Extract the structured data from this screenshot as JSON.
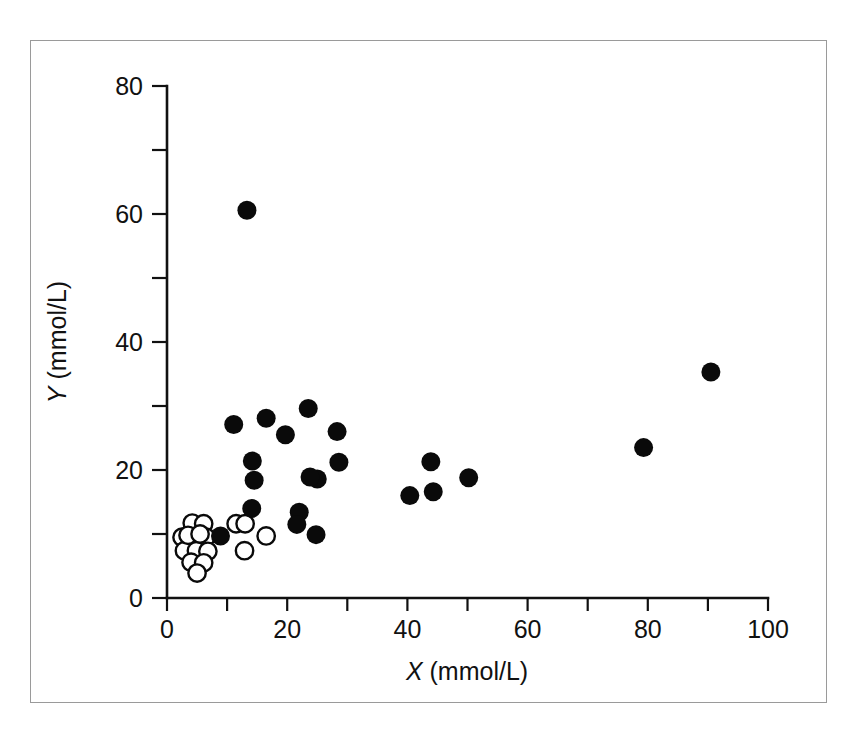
{
  "figure": {
    "background_color": "#ffffff",
    "frame_color": "#9a9a9a",
    "ink_color": "#0a0a0a"
  },
  "axis": {
    "x_title_var": "X",
    "x_title_unit": " (mmol/L)",
    "y_title_var": "Y",
    "y_title_unit": " (mmol/L)",
    "x_tick_labels": [
      "0",
      "20",
      "40",
      "60",
      "80",
      "100"
    ],
    "y_tick_labels": [
      "0",
      "20",
      "40",
      "60",
      "80"
    ]
  },
  "chart_data": {
    "type": "scatter",
    "title": "",
    "xlabel": "X (mmol/L)",
    "ylabel": "Y (mmol/L)",
    "xlim": [
      0,
      100
    ],
    "ylim": [
      0,
      80
    ],
    "xticks": [
      0,
      20,
      40,
      60,
      80,
      100
    ],
    "yticks": [
      0,
      20,
      40,
      60,
      80
    ],
    "x_minor_tick_step": 10,
    "y_minor_tick_step": 10,
    "grid": false,
    "legend": null,
    "series": [
      {
        "name": "filled-circles",
        "marker": "filled circle",
        "color": "#0a0a0a",
        "points": [
          [
            13.3,
            60.6
          ],
          [
            11.1,
            27.1
          ],
          [
            16.5,
            28.1
          ],
          [
            19.7,
            25.5
          ],
          [
            23.5,
            29.6
          ],
          [
            28.3,
            26.0
          ],
          [
            14.2,
            21.4
          ],
          [
            28.6,
            21.2
          ],
          [
            14.5,
            18.4
          ],
          [
            25.0,
            18.6
          ],
          [
            23.8,
            18.9
          ],
          [
            14.1,
            14.0
          ],
          [
            22.0,
            13.4
          ],
          [
            21.6,
            11.5
          ],
          [
            24.8,
            9.9
          ],
          [
            8.9,
            9.7
          ],
          [
            40.4,
            16.0
          ],
          [
            43.9,
            21.3
          ],
          [
            44.3,
            16.6
          ],
          [
            50.2,
            18.8
          ],
          [
            79.3,
            23.5
          ],
          [
            90.5,
            35.3
          ]
        ]
      },
      {
        "name": "open-circles",
        "marker": "open circle",
        "color": "#ffffff",
        "edge_color": "#0a0a0a",
        "points": [
          [
            4.2,
            11.7
          ],
          [
            6.1,
            11.6
          ],
          [
            2.5,
            9.5
          ],
          [
            4.6,
            9.6
          ],
          [
            6.5,
            9.5
          ],
          [
            2.9,
            7.4
          ],
          [
            4.9,
            7.4
          ],
          [
            6.8,
            7.3
          ],
          [
            4.0,
            5.6
          ],
          [
            6.1,
            5.5
          ],
          [
            5.0,
            3.9
          ],
          [
            3.5,
            9.8
          ],
          [
            5.5,
            10.0
          ],
          [
            11.5,
            11.6
          ],
          [
            13.0,
            11.6
          ],
          [
            16.5,
            9.7
          ],
          [
            12.9,
            7.4
          ]
        ]
      }
    ]
  }
}
